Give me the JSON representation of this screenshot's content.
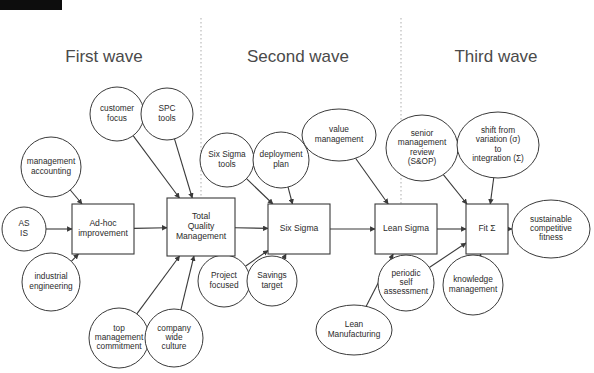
{
  "page": {
    "background_color": "#ffffff",
    "width": 594,
    "height": 373
  },
  "banner": {
    "name": "cropped-figure-label",
    "color": "#0d0d0d",
    "text": ""
  },
  "waves": [
    {
      "id": "first",
      "label": "First wave",
      "x": 104,
      "y": 58
    },
    {
      "id": "second",
      "label": "Second wave",
      "x": 298,
      "y": 58
    },
    {
      "id": "third",
      "label": "Third wave",
      "x": 496,
      "y": 58
    }
  ],
  "dividers": [
    {
      "id": "divider-1",
      "x": 201,
      "y1": 18,
      "y2": 206
    },
    {
      "id": "divider-2",
      "x": 401,
      "y1": 18,
      "y2": 206
    }
  ],
  "boxes": [
    {
      "id": "ad-hoc-improvement",
      "lines": [
        "Ad-hoc",
        "improvement"
      ],
      "x": 72,
      "y": 204,
      "w": 62,
      "h": 50
    },
    {
      "id": "total-quality-management",
      "lines": [
        "Total",
        "Quality",
        "Management"
      ],
      "x": 167,
      "y": 198,
      "w": 68,
      "h": 58
    },
    {
      "id": "six-sigma",
      "lines": [
        "Six Sigma"
      ],
      "x": 268,
      "y": 204,
      "w": 62,
      "h": 50
    },
    {
      "id": "lean-sigma",
      "lines": [
        "Lean Sigma"
      ],
      "x": 375,
      "y": 204,
      "w": 62,
      "h": 50
    },
    {
      "id": "fit-sigma",
      "lines": [
        "Fit Σ"
      ],
      "x": 466,
      "y": 204,
      "w": 42,
      "h": 50
    }
  ],
  "nodes": [
    {
      "id": "as-is",
      "lines": [
        "AS",
        "IS"
      ],
      "cx": 24,
      "cy": 229,
      "rx": 22,
      "ry": 22
    },
    {
      "id": "management-accounting",
      "lines": [
        "management",
        "accounting"
      ],
      "cx": 51,
      "cy": 167,
      "rx": 30,
      "ry": 30
    },
    {
      "id": "industrial-engineering",
      "lines": [
        "industrial",
        "engineering"
      ],
      "cx": 51,
      "cy": 282,
      "rx": 29,
      "ry": 29
    },
    {
      "id": "customer-focus",
      "lines": [
        "customer",
        "focus"
      ],
      "cx": 117,
      "cy": 114,
      "rx": 27,
      "ry": 27
    },
    {
      "id": "spc-tools",
      "lines": [
        "SPC",
        "tools"
      ],
      "cx": 167,
      "cy": 114,
      "rx": 26,
      "ry": 26
    },
    {
      "id": "top-management-commitment",
      "lines": [
        "top",
        "management",
        "commitment"
      ],
      "cx": 119,
      "cy": 338,
      "rx": 30,
      "ry": 30
    },
    {
      "id": "company-wide-culture",
      "lines": [
        "company",
        "wide",
        "culture"
      ],
      "cx": 174,
      "cy": 338,
      "rx": 29,
      "ry": 29
    },
    {
      "id": "six-sigma-tools",
      "lines": [
        "Six Sigma",
        "tools"
      ],
      "cx": 227,
      "cy": 160,
      "rx": 27,
      "ry": 27
    },
    {
      "id": "deployment-plan",
      "lines": [
        "deployment",
        "plan"
      ],
      "cx": 281,
      "cy": 160,
      "rx": 28,
      "ry": 28
    },
    {
      "id": "project-focused",
      "lines": [
        "Project",
        "focused"
      ],
      "cx": 224,
      "cy": 281,
      "rx": 26,
      "ry": 26
    },
    {
      "id": "savings-target",
      "lines": [
        "Savings",
        "target"
      ],
      "cx": 272,
      "cy": 281,
      "rx": 25,
      "ry": 25
    },
    {
      "id": "value-management",
      "lines": [
        "value",
        "management"
      ],
      "cx": 339,
      "cy": 135,
      "rx": 37,
      "ry": 26
    },
    {
      "id": "lean-manufacturing",
      "lines": [
        "Lean",
        "Manufacturing"
      ],
      "cx": 354,
      "cy": 330,
      "rx": 38,
      "ry": 25
    },
    {
      "id": "senior-management-review",
      "lines": [
        "senior",
        "management",
        "review",
        "(S&OP)"
      ],
      "cx": 422,
      "cy": 148,
      "rx": 36,
      "ry": 33
    },
    {
      "id": "shift-from-variation",
      "lines": [
        "shift from",
        "variation (σ)",
        "to",
        "integration (Σ)"
      ],
      "cx": 498,
      "cy": 145,
      "rx": 41,
      "ry": 33
    },
    {
      "id": "periodic-self-assessment",
      "lines": [
        "periodic",
        "self",
        "assessment"
      ],
      "cx": 406,
      "cy": 283,
      "rx": 28,
      "ry": 28
    },
    {
      "id": "knowledge-management",
      "lines": [
        "knowledge",
        "management"
      ],
      "cx": 473,
      "cy": 285,
      "rx": 30,
      "ry": 30
    },
    {
      "id": "sustainable-competitive-fitness",
      "lines": [
        "sustainable",
        "competitive",
        "fitness"
      ],
      "cx": 551,
      "cy": 229,
      "rx": 39,
      "ry": 29
    }
  ],
  "connections": [
    {
      "from": "as-is",
      "to": "ad-hoc-improvement"
    },
    {
      "from": "management-accounting",
      "to": "ad-hoc-improvement"
    },
    {
      "from": "industrial-engineering",
      "to": "ad-hoc-improvement"
    },
    {
      "from": "ad-hoc-improvement",
      "to": "total-quality-management"
    },
    {
      "from": "customer-focus",
      "to": "total-quality-management"
    },
    {
      "from": "spc-tools",
      "to": "total-quality-management"
    },
    {
      "from": "top-management-commitment",
      "to": "total-quality-management"
    },
    {
      "from": "company-wide-culture",
      "to": "total-quality-management"
    },
    {
      "from": "total-quality-management",
      "to": "six-sigma"
    },
    {
      "from": "six-sigma-tools",
      "to": "six-sigma"
    },
    {
      "from": "deployment-plan",
      "to": "six-sigma"
    },
    {
      "from": "project-focused",
      "to": "six-sigma"
    },
    {
      "from": "savings-target",
      "to": "six-sigma"
    },
    {
      "from": "six-sigma",
      "to": "lean-sigma"
    },
    {
      "from": "value-management",
      "to": "lean-sigma"
    },
    {
      "from": "lean-manufacturing",
      "to": "lean-sigma"
    },
    {
      "from": "lean-sigma",
      "to": "fit-sigma"
    },
    {
      "from": "senior-management-review",
      "to": "fit-sigma"
    },
    {
      "from": "shift-from-variation",
      "to": "fit-sigma"
    },
    {
      "from": "periodic-self-assessment",
      "to": "fit-sigma"
    },
    {
      "from": "knowledge-management",
      "to": "fit-sigma"
    },
    {
      "from": "fit-sigma",
      "to": "sustainable-competitive-fitness"
    }
  ]
}
